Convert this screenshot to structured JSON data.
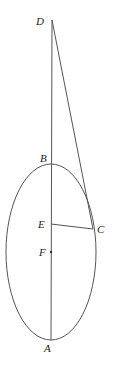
{
  "diagram": {
    "type": "ellipse-tangent-geometry",
    "points": {
      "A": {
        "label": "A",
        "x": 51,
        "y": 340
      },
      "B": {
        "label": "B",
        "x": 51,
        "y": 164
      },
      "C": {
        "label": "C",
        "x": 93,
        "y": 229
      },
      "D": {
        "label": "D",
        "x": 52,
        "y": 20
      },
      "E": {
        "label": "E",
        "x": 51,
        "y": 224
      },
      "F": {
        "label": "F",
        "x": 51,
        "y": 252
      }
    },
    "labels": {
      "A": "A",
      "B": "B",
      "C": "C",
      "D": "D",
      "E": "E",
      "F": "F"
    },
    "ellipse": {
      "cx": 51,
      "cy": 252,
      "rx": 45,
      "ry": 88
    },
    "segments": [
      "D-A",
      "D-C",
      "E-C"
    ],
    "colors": {
      "stroke": "#555555",
      "text": "#222222"
    }
  }
}
